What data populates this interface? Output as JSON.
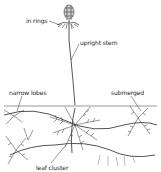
{
  "diagram": {
    "labels": {
      "in_rings": "in rings",
      "upright_stem": "upright stem",
      "narrow_lobes": "narrow lobes",
      "submerged": "submerged",
      "leaf_cluster": "leaf cluster"
    },
    "colors": {
      "background": "#ffffff",
      "ink": "#333333",
      "text": "#222222"
    }
  }
}
